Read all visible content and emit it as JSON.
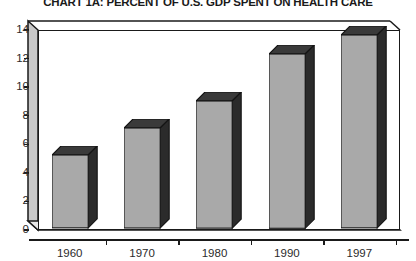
{
  "chart_data": {
    "type": "bar",
    "title": "CHART 1A: PERCENT OF U.S. GDP SPENT ON HEALTH CARE",
    "categories": [
      "1960",
      "1970",
      "1980",
      "1990",
      "1997"
    ],
    "values": [
      5.1,
      7.0,
      8.9,
      12.2,
      13.5
    ],
    "xlabel": "",
    "ylabel": "",
    "ylim": [
      0,
      14
    ],
    "ytick_labels": [
      "0",
      "2",
      "4",
      "6",
      "8",
      "10",
      "12",
      "14"
    ],
    "ytick_values": [
      0,
      2,
      4,
      6,
      8,
      10,
      12,
      14
    ],
    "grid": false,
    "legend": null,
    "style": {
      "three_d": true,
      "bar_front_color": "#a9a9a9",
      "bar_side_color": "#2b2b2b",
      "bar_top_color": "#3a3a3a",
      "axis_color": "#1a1a1a",
      "wall_color": "#c9c9c9",
      "background": "#ffffff",
      "text_color": "#2b2b2b"
    }
  }
}
